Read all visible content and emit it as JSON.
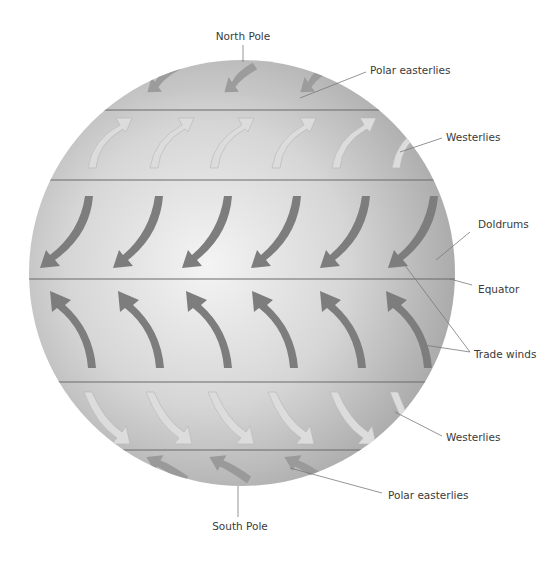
{
  "labels": {
    "north_pole": "North Pole",
    "south_pole": "South Pole",
    "polar_easterlies_north": "Polar easterlies",
    "westerlies_north": "Westerlies",
    "doldrums": "Doldrums",
    "equator": "Equator",
    "trade_winds": "Trade winds",
    "westerlies_south": "Westerlies",
    "polar_easterlies_south": "Polar easterlies"
  },
  "colors": {
    "globe_light": "#efefef",
    "globe_mid": "#c9c9c9",
    "globe_edge": "#a9a9a9",
    "latitude_line": "#6b6b6b",
    "trade_arrow": "#7b7b7b",
    "westerly_arrow": "#d8d8d8",
    "polar_arrow": "#9a9a9a",
    "leader_line": "#7a7a7a"
  },
  "latitude_lines_y": [
    110,
    180,
    279,
    382,
    450
  ],
  "wind_belts": [
    {
      "name": "Polar easterlies (N)",
      "direction": "east-to-west, toward equator",
      "count": 3
    },
    {
      "name": "Westerlies (N)",
      "direction": "west-to-east, poleward",
      "count": 6
    },
    {
      "name": "Trade winds (N)",
      "direction": "north-east, toward equator",
      "count": 6
    },
    {
      "name": "Trade winds (S)",
      "direction": "south-east, toward equator",
      "count": 6
    },
    {
      "name": "Westerlies (S)",
      "direction": "west-to-east, poleward",
      "count": 6
    },
    {
      "name": "Polar easterlies (S)",
      "direction": "east-to-west, toward equator",
      "count": 3
    }
  ]
}
